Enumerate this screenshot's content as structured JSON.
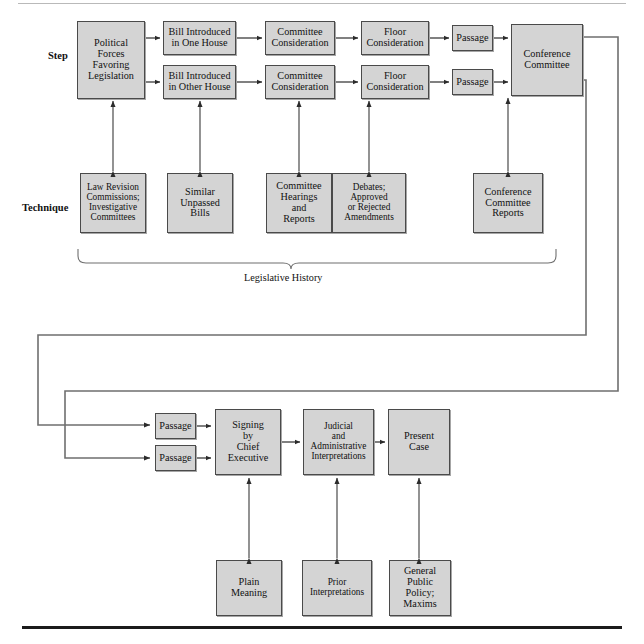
{
  "diagram": {
    "title_rules": {
      "top": "thin-rule",
      "bottom": "thick-rule"
    },
    "row_labels": [
      {
        "name": "step",
        "text": "Step"
      },
      {
        "name": "technique",
        "text": "Technique"
      }
    ],
    "brace_caption": "Legislative History",
    "colors": {
      "box_fill": "#d4d4d4",
      "box_border": "#4a4a4a",
      "line": "#5a5a5a",
      "arrow": "#2b2b2b",
      "text": "#111111",
      "rule_top": "#b9b9b9",
      "rule_bottom": "#1b1b1b"
    },
    "boxes": {
      "political_forces": "Political\nForces\nFavoring\nLegislation",
      "bill_one_house": "Bill Introduced\nin One House",
      "bill_other_house": "Bill Introduced\nin Other House",
      "committee_consideration_1": "Committee\nConsideration",
      "committee_consideration_2": "Committee\nConsideration",
      "floor_consideration_1": "Floor\nConsideration",
      "floor_consideration_2": "Floor\nConsideration",
      "passage_1": "Passage",
      "passage_2": "Passage",
      "conference_committee": "Conference\nCommittee",
      "law_revision": "Law Revision\nCommissions;\nInvestigative\nCommittees",
      "similar_unpassed_bills": "Similar\nUnpassed\nBills",
      "committee_hearings": "Committee\nHearings\nand\nReports",
      "debates": "Debates;\nApproved\nor Rejected\nAmendments",
      "conference_committee_reports": "Conference\nCommittee\nReports",
      "passage_3": "Passage",
      "passage_4": "Passage",
      "signing": "Signing\nby\nChief\nExecutive",
      "judicial": "Judicial\nand\nAdministrative\nInterpretations",
      "present_case": "Present\nCase",
      "plain_meaning": "Plain\nMeaning",
      "prior_interpretations": "Prior\nInterpretations",
      "general_public_policy": "General\nPublic\nPolicy;\nMaxims"
    }
  }
}
